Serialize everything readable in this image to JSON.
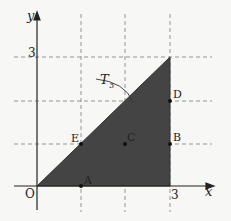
{
  "diagram": {
    "type": "coordinate-plane-region",
    "axes": {
      "x_label": "x",
      "y_label": "y",
      "origin_label": "O",
      "x_tick_label": "3",
      "y_tick_label": "3"
    },
    "region": {
      "name": "T",
      "subscript": "3",
      "vertices": [
        [
          0,
          0
        ],
        [
          3,
          0
        ],
        [
          3,
          3
        ]
      ],
      "fill": "#444444"
    },
    "grid": {
      "min": 0,
      "max": 3,
      "step": 1,
      "style": "dashed"
    },
    "points": [
      {
        "label": "A",
        "x": 1,
        "y": 0
      },
      {
        "label": "B",
        "x": 3,
        "y": 1
      },
      {
        "label": "C",
        "x": 2,
        "y": 1
      },
      {
        "label": "D",
        "x": 3,
        "y": 2
      },
      {
        "label": "E",
        "x": 1,
        "y": 1
      }
    ]
  }
}
